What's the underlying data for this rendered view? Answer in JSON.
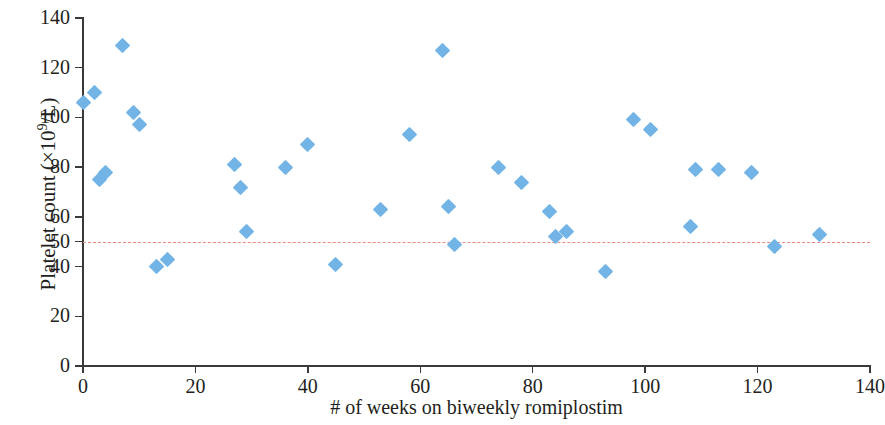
{
  "chart_data": {
    "type": "scatter",
    "title": "",
    "xlabel": "# of weeks on biweekly romiplostim",
    "ylabel": "Platelet count (×10⁹/L)",
    "ylabel_parts": {
      "main": "Platelet count (×10",
      "sup": "9",
      "tail": "/L)"
    },
    "xlim": [
      0,
      140
    ],
    "ylim": [
      0,
      140
    ],
    "xticks": [
      0,
      20,
      40,
      60,
      80,
      100,
      120,
      140
    ],
    "yticks": [
      0,
      20,
      40,
      50,
      60,
      80,
      100,
      120,
      140
    ],
    "xticklabels": [
      "0",
      "20",
      "40",
      "60",
      "80",
      "100",
      "120",
      "140"
    ],
    "yticklabels": [
      "0",
      "20",
      "40",
      "50",
      "60",
      "80",
      "100",
      "120",
      "140"
    ],
    "grid": false,
    "legend": false,
    "marker": {
      "shape": "diamond",
      "color": "#73b4e7",
      "size": 11
    },
    "threshold_line": {
      "value": 50,
      "orientation": "horizontal",
      "style": "dashed",
      "color": "#ec8a80",
      "x_start": 0,
      "x_end": 140
    },
    "series": [
      {
        "name": "Platelet count",
        "points": [
          {
            "x": 0,
            "y": 106
          },
          {
            "x": 2,
            "y": 110
          },
          {
            "x": 3,
            "y": 75
          },
          {
            "x": 4,
            "y": 78
          },
          {
            "x": 7,
            "y": 129
          },
          {
            "x": 9,
            "y": 102
          },
          {
            "x": 10,
            "y": 97
          },
          {
            "x": 13,
            "y": 40
          },
          {
            "x": 15,
            "y": 43
          },
          {
            "x": 27,
            "y": 81
          },
          {
            "x": 28,
            "y": 72
          },
          {
            "x": 29,
            "y": 54
          },
          {
            "x": 36,
            "y": 80
          },
          {
            "x": 40,
            "y": 89
          },
          {
            "x": 45,
            "y": 41
          },
          {
            "x": 53,
            "y": 63
          },
          {
            "x": 58,
            "y": 93
          },
          {
            "x": 64,
            "y": 127
          },
          {
            "x": 65,
            "y": 64
          },
          {
            "x": 66,
            "y": 49
          },
          {
            "x": 74,
            "y": 80
          },
          {
            "x": 78,
            "y": 74
          },
          {
            "x": 83,
            "y": 62
          },
          {
            "x": 84,
            "y": 52
          },
          {
            "x": 86,
            "y": 54
          },
          {
            "x": 93,
            "y": 38
          },
          {
            "x": 98,
            "y": 99
          },
          {
            "x": 101,
            "y": 95
          },
          {
            "x": 108,
            "y": 56
          },
          {
            "x": 109,
            "y": 79
          },
          {
            "x": 113,
            "y": 79
          },
          {
            "x": 119,
            "y": 78
          },
          {
            "x": 123,
            "y": 48
          },
          {
            "x": 131,
            "y": 53
          }
        ]
      }
    ]
  }
}
